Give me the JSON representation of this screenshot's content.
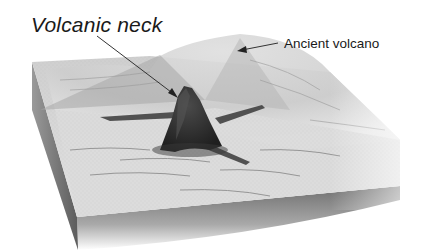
{
  "figure": {
    "type": "block diagram",
    "labels": [
      {
        "id": "volcanic_neck",
        "text": "Volcanic neck",
        "style": "italic"
      },
      {
        "id": "ancient_volcano",
        "text": "Ancient volcano",
        "style": "regular"
      }
    ]
  },
  "colors": {
    "background": "#ffffff",
    "text": "#1a1a1a",
    "arrow": "#333333",
    "land_surface": "#d9d9d9",
    "volcano_mound": "#e6e6e6",
    "neck": "#2e2e2e",
    "block_side": "#8a8a8a"
  }
}
